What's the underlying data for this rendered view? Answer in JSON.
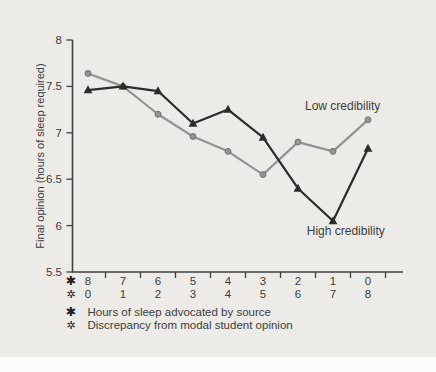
{
  "page": {
    "background": "#ECEBE7",
    "margin_color": "#FBFBFA"
  },
  "chart_data": {
    "type": "line",
    "title": "",
    "ylabel": "Final opinion (hours of sleep required)",
    "ylim": [
      5.5,
      8
    ],
    "yticks": [
      "8",
      "7.5",
      "7",
      "6.5",
      "6",
      "5.5"
    ],
    "axis_color": "#3F3F3F",
    "text_color": "#3C3C3C",
    "grid": "off",
    "x_rows": [
      {
        "symbol": "✱",
        "symbol_name": "heavy-asterisk",
        "legend": "Hours of sleep advocated by source",
        "values": [
          "8",
          "7",
          "6",
          "5",
          "4",
          "3",
          "2",
          "1",
          "0"
        ]
      },
      {
        "symbol": "✲",
        "symbol_name": "open-centre-asterisk",
        "legend": "Discrepancy from modal student opinion",
        "values": [
          "0",
          "1",
          "2",
          "3",
          "4",
          "5",
          "6",
          "7",
          "8"
        ]
      }
    ],
    "series": [
      {
        "name": "Low credibility",
        "color": "#939393",
        "marker": "circle",
        "values": [
          7.64,
          7.5,
          7.2,
          6.96,
          6.8,
          6.55,
          6.9,
          6.8,
          7.14
        ],
        "label_at": {
          "index": 6.2,
          "value": 7.29
        }
      },
      {
        "name": "High credibility",
        "color": "#2B2B2B",
        "marker": "triangle",
        "values": [
          7.46,
          7.5,
          7.45,
          7.1,
          7.25,
          6.95,
          6.4,
          6.05,
          6.83
        ],
        "label_at": {
          "index": 6.25,
          "value": 5.94
        }
      }
    ]
  }
}
